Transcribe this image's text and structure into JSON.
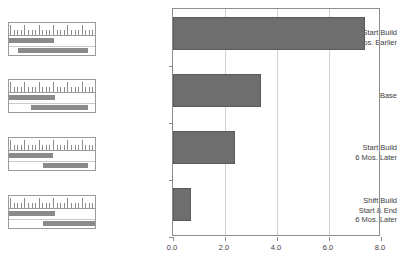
{
  "chart_data": {
    "type": "bar",
    "orientation": "horizontal",
    "title": "",
    "xlabel": "",
    "ylabel": "",
    "xlim": [
      0.0,
      8.0
    ],
    "xticks": [
      "0.0",
      "2.0",
      "4.0",
      "6.0",
      "8.0"
    ],
    "xtick_values": [
      0.0,
      2.0,
      4.0,
      6.0,
      8.0
    ],
    "grid": true,
    "grid_axis": "x",
    "legend": "none",
    "bar_color": "#6e6e6e",
    "categories": [
      "Start Build\n6 Mos. Earlier",
      "Base",
      "Start Build\n6 Mos. Later",
      "Shift Build\nStart & End\n6 Mos. Later"
    ],
    "values": [
      7.4,
      3.4,
      2.4,
      0.7
    ]
  },
  "thumbnails": [
    {
      "name": "schedule-thumb-start-build-earlier",
      "bars": [
        {
          "start_pct": 0,
          "width_pct": 52,
          "row": 0
        },
        {
          "start_pct": 11,
          "width_pct": 81,
          "row": 1
        }
      ]
    },
    {
      "name": "schedule-thumb-base",
      "bars": [
        {
          "start_pct": 0,
          "width_pct": 53,
          "row": 0
        },
        {
          "start_pct": 25,
          "width_pct": 67,
          "row": 1
        }
      ]
    },
    {
      "name": "schedule-thumb-start-build-later",
      "bars": [
        {
          "start_pct": 0,
          "width_pct": 51,
          "row": 0
        },
        {
          "start_pct": 39,
          "width_pct": 53,
          "row": 1
        }
      ]
    },
    {
      "name": "schedule-thumb-shift-build",
      "bars": [
        {
          "start_pct": 0,
          "width_pct": 53,
          "row": 0
        },
        {
          "start_pct": 39,
          "width_pct": 61,
          "row": 1
        }
      ]
    }
  ],
  "colors": {
    "bar": "#6e6e6e",
    "thumb_bar": "#8a8a8a",
    "axis": "#8d8d8d",
    "gridline": "#d2d2d2",
    "text": "#3d3d3d"
  }
}
